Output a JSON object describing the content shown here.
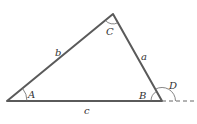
{
  "diagram": {
    "type": "triangle",
    "vertices": {
      "A": "A",
      "B": "B",
      "C": "C"
    },
    "sides": {
      "a": "a",
      "b": "b",
      "c": "c"
    },
    "exterior_angle": "D",
    "colors": {
      "side": "#5a5a5a",
      "arc": "#666666"
    }
  }
}
